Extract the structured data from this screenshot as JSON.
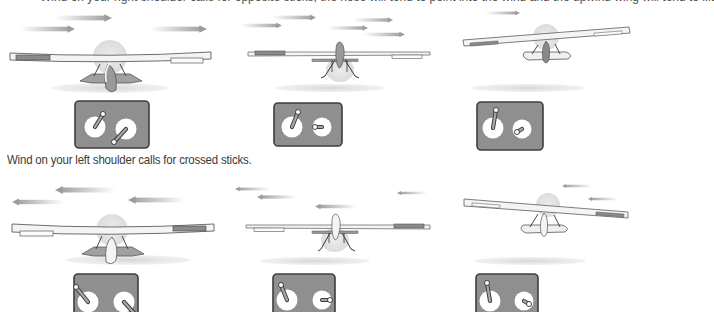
{
  "top_caption_partial": "Wind on your right shoulder calls for opposite sticks; the nose will tend to point into the wind and the upwind wing will tend to lift",
  "middle_caption": "Wind on your left shoulder calls for crossed sticks.",
  "colors": {
    "wind_arrow": "#a8a8a8",
    "wing_fill": "#f4f4f4",
    "wing_outline": "#6e6e6e",
    "aileron_down": "#8a8a8a",
    "transmitter_body": "#8f8f8f",
    "transmitter_border": "#4a4a4a",
    "gimbal": "#ffffff",
    "shadow": "#d8d8d8",
    "spinner_disc": "#e2e2e2",
    "text": "#3a3a3a"
  },
  "rows": [
    {
      "wind_direction": "right",
      "panels": [
        {
          "id": "top-left",
          "bank": "level-yaw-left",
          "left_stick": "up-right",
          "right_stick": "down-left"
        },
        {
          "id": "top-center",
          "bank": "level",
          "left_stick": "up-right",
          "right_stick": "left"
        },
        {
          "id": "top-right",
          "bank": "right-wing-high",
          "left_stick": "up",
          "right_stick": "down-left"
        }
      ]
    },
    {
      "wind_direction": "left",
      "panels": [
        {
          "id": "bottom-left",
          "bank": "level-yaw-right",
          "left_stick": "up-left",
          "right_stick": "down-right"
        },
        {
          "id": "bottom-center",
          "bank": "level",
          "left_stick": "up-left",
          "right_stick": "right"
        },
        {
          "id": "bottom-right",
          "bank": "left-wing-high",
          "left_stick": "up",
          "right_stick": "down-right"
        }
      ]
    }
  ]
}
